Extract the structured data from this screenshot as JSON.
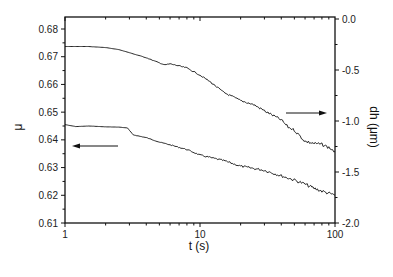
{
  "chart_data": {
    "type": "line",
    "title": "",
    "xlabel": "t (s)",
    "xscale": "log",
    "xlim": [
      1,
      100
    ],
    "x_ticks": [
      "1",
      "10",
      "100"
    ],
    "ylabel_left": "μ",
    "ylim_left": [
      0.61,
      0.68
    ],
    "y_ticks_left": [
      "0.61",
      "0.62",
      "0.63",
      "0.64",
      "0.65",
      "0.66",
      "0.67",
      "0.68"
    ],
    "ylabel_right": "dh (μm)",
    "ylim_right": [
      -2.0,
      0.0
    ],
    "y_ticks_right": [
      "-2.0",
      "-1.5",
      "-1.0",
      "-0.5",
      "0.0"
    ],
    "grid": false,
    "legend": null,
    "annotations": [
      {
        "type": "arrow",
        "direction": "left",
        "indicates": "friction coefficient μ uses left axis"
      },
      {
        "type": "arrow",
        "direction": "right",
        "indicates": "dh uses right axis"
      }
    ],
    "series": [
      {
        "name": "μ (friction coefficient)",
        "axis": "left",
        "x": [
          1,
          1.2,
          1.5,
          2,
          2.5,
          2.9,
          3.2,
          4,
          5,
          6,
          8,
          10,
          15,
          20,
          30,
          40,
          50,
          60,
          70,
          80,
          100
        ],
        "values": [
          0.6455,
          0.6448,
          0.645,
          0.6447,
          0.6446,
          0.6443,
          0.6418,
          0.6408,
          0.6392,
          0.6382,
          0.6365,
          0.6345,
          0.6325,
          0.6305,
          0.629,
          0.627,
          0.6255,
          0.624,
          0.6225,
          0.6215,
          0.62
        ]
      },
      {
        "name": "dh (wear depth)",
        "axis": "right",
        "x": [
          1,
          1.5,
          2,
          2.5,
          3,
          4,
          5,
          5.5,
          6,
          7,
          8,
          10,
          12,
          15,
          20,
          25,
          30,
          40,
          45,
          50,
          60,
          70,
          80,
          90,
          100
        ],
        "values": [
          -0.27,
          -0.27,
          -0.28,
          -0.3,
          -0.33,
          -0.38,
          -0.43,
          -0.45,
          -0.44,
          -0.46,
          -0.48,
          -0.55,
          -0.62,
          -0.72,
          -0.8,
          -0.84,
          -0.9,
          -0.99,
          -1.06,
          -1.09,
          -1.2,
          -1.22,
          -1.23,
          -1.26,
          -1.3
        ]
      }
    ]
  }
}
